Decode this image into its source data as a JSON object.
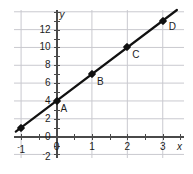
{
  "chart_data": {
    "type": "line",
    "title": "",
    "xlabel": "x",
    "ylabel": "y",
    "xlim": [
      -1.2,
      3.6
    ],
    "ylim": [
      -2.4,
      14.2
    ],
    "grid": true,
    "legend": "none",
    "x_ticks": [
      -1,
      0,
      1,
      2,
      3
    ],
    "x_tick_labels": [
      "-1",
      "0",
      "1",
      "2",
      "3"
    ],
    "y_ticks": [
      -2,
      0,
      2,
      4,
      6,
      8,
      10,
      12
    ],
    "y_tick_labels": [
      "-2",
      "0",
      "2",
      "4",
      "6",
      "8",
      "10",
      "12"
    ],
    "x_minor_tick_step": 0.5,
    "y_minor_tick_step": 1,
    "line": {
      "equation": "y = 3x + 4",
      "slope": 3,
      "intercept": 4,
      "color": "#111111",
      "x_start": -1.15,
      "x_end": 3.4
    },
    "series": [
      {
        "name": "line",
        "x": [
          -1,
          0,
          1,
          2,
          3
        ],
        "y": [
          1,
          4,
          7,
          10,
          13
        ]
      }
    ],
    "points": [
      {
        "label": "",
        "x": -1,
        "y": 1,
        "label_dx": 0,
        "label_dy": 0,
        "show_label": false
      },
      {
        "label": "A",
        "x": 0,
        "y": 4,
        "label_dx": 4,
        "label_dy": 12,
        "show_label": true
      },
      {
        "label": "B",
        "x": 1,
        "y": 7,
        "label_dx": 5,
        "label_dy": 12,
        "show_label": true
      },
      {
        "label": "C",
        "x": 2,
        "y": 10,
        "label_dx": 5,
        "label_dy": 12,
        "show_label": true
      },
      {
        "label": "D",
        "x": 3,
        "y": 13,
        "label_dx": 6,
        "label_dy": 10,
        "show_label": true
      }
    ],
    "colors": {
      "grid": "#c9c9cf",
      "axis": "#4a4a4a",
      "line": "#111111",
      "point": "#111111",
      "text": "#1c1c1c",
      "background": "#ffffff"
    }
  }
}
